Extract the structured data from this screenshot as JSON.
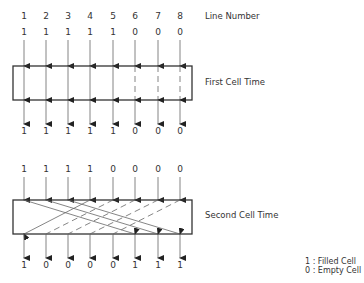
{
  "line_numbers": [
    "1",
    "2",
    "3",
    "4",
    "5",
    "6",
    "7",
    "8"
  ],
  "labels": {
    "line_number": "Line Number",
    "first_cell_time": "First Cell Time",
    "second_cell_time": "Second Cell Time"
  },
  "first_stage": {
    "inputs": [
      "1",
      "1",
      "1",
      "1",
      "1",
      "0",
      "0",
      "0"
    ],
    "outputs": [
      "1",
      "1",
      "1",
      "1",
      "1",
      "0",
      "0",
      "0"
    ]
  },
  "second_stage": {
    "inputs": [
      "1",
      "1",
      "1",
      "1",
      "0",
      "0",
      "0",
      "0"
    ],
    "outputs": [
      "1",
      "0",
      "0",
      "0",
      "0",
      "1",
      "1",
      "1"
    ],
    "routing": [
      {
        "from": 1,
        "to": 6,
        "style": "solid"
      },
      {
        "from": 2,
        "to": 7,
        "style": "solid"
      },
      {
        "from": 3,
        "to": 8,
        "style": "solid"
      },
      {
        "from": 4,
        "to": 1,
        "style": "solid"
      },
      {
        "from": 5,
        "to": 2,
        "style": "dashed"
      },
      {
        "from": 6,
        "to": 3,
        "style": "dashed"
      },
      {
        "from": 7,
        "to": 4,
        "style": "dashed"
      },
      {
        "from": 8,
        "to": 5,
        "style": "dashed"
      }
    ]
  },
  "legend": {
    "filled": "1 : Filled Cell",
    "empty": "0 : Empty Cell"
  },
  "colors": {
    "stroke": "#333333",
    "line": "#555555"
  }
}
